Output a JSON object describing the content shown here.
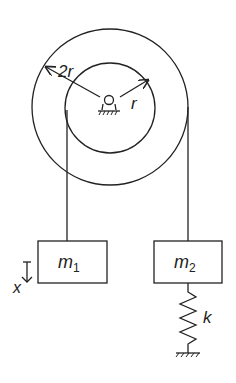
{
  "diagram": {
    "labels": {
      "outer_radius": "2r",
      "inner_radius": "r",
      "mass1": "m",
      "mass1_sub": "1",
      "mass2": "m",
      "mass2_sub": "2",
      "spring": "k",
      "displacement": "x"
    },
    "colors": {
      "stroke": "#222222",
      "background": "#ffffff"
    }
  }
}
